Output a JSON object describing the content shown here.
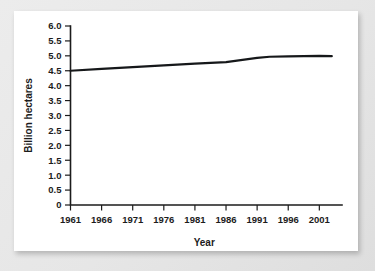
{
  "figure": {
    "background_color": "#e8e8e8",
    "card_color": "#ffffff",
    "line_color": "#16181a",
    "axis_color": "#1c1c1c"
  },
  "chart_data": {
    "type": "line",
    "title": "",
    "xlabel": "Year",
    "ylabel": "Billion hectares",
    "xlim": [
      1961,
      2004
    ],
    "ylim": [
      0,
      6.0
    ],
    "grid": false,
    "legend": null,
    "yticks": [
      0,
      0.5,
      1.0,
      1.5,
      2.0,
      2.5,
      3.0,
      3.5,
      4.0,
      4.5,
      5.0,
      5.5,
      6.0
    ],
    "ytick_labels": [
      "0",
      "0.5",
      "1.0",
      "1.5",
      "2.0",
      "2.5",
      "3.0",
      "3.5",
      "4.0",
      "4.5",
      "5.0",
      "5.5",
      "6.0"
    ],
    "xticks": [
      1961,
      1966,
      1971,
      1976,
      1981,
      1986,
      1991,
      1996,
      2001
    ],
    "xtick_labels": [
      "1961",
      "1966",
      "1971",
      "1976",
      "1981",
      "1986",
      "1991",
      "1996",
      "2001"
    ],
    "series": [
      {
        "name": "Agricultural land",
        "x": [
          1961,
          1966,
          1971,
          1976,
          1981,
          1986,
          1991,
          1993,
          1996,
          2001,
          2003
        ],
        "values": [
          4.5,
          4.56,
          4.62,
          4.68,
          4.74,
          4.79,
          4.93,
          4.97,
          4.98,
          5.0,
          4.99
        ]
      }
    ]
  }
}
